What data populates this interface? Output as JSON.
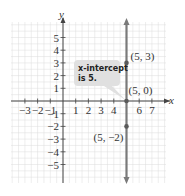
{
  "chart_data": {
    "type": "line",
    "title": "",
    "xlabel": "x",
    "ylabel": "y",
    "xlim": [
      -4,
      8
    ],
    "ylim": [
      -6,
      6
    ],
    "grid": true,
    "x_ticks": [
      -3,
      -2,
      -1,
      1,
      2,
      3,
      4,
      6,
      7
    ],
    "x_tick_labels": [
      "−3",
      "−2",
      "−1",
      "1",
      "2",
      "3",
      "4",
      "6",
      "7"
    ],
    "y_ticks": [
      5,
      4,
      3,
      2,
      1,
      -1,
      -2,
      -3,
      -4,
      -5
    ],
    "y_tick_labels": [
      "5",
      "4",
      "3",
      "2",
      "1",
      "−1",
      "−2",
      "−3",
      "−4",
      "−5"
    ],
    "series": [
      {
        "name": "x = 5",
        "equation": "x = 5",
        "kind": "vertical-line",
        "x": [
          5,
          5
        ],
        "y": [
          -6,
          6
        ]
      }
    ],
    "points": [
      {
        "x": 5,
        "y": 3,
        "label": "(5, 3)"
      },
      {
        "x": 5,
        "y": 0,
        "label": "(5, 0)"
      },
      {
        "x": 5,
        "y": -2,
        "label": "(5, −2)"
      }
    ],
    "annotations": [
      {
        "text_line1": "x-intercept",
        "text_line2": "is 5.",
        "points_to": {
          "x": 5,
          "y": 0
        }
      }
    ],
    "colors": {
      "line": "#7a7a7a",
      "grid": "#dcdcdc",
      "axis": "#444444",
      "callout_bg": "#e0e0e0"
    }
  }
}
